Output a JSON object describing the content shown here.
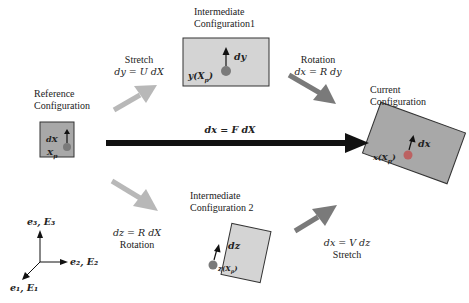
{
  "diagram": {
    "reference": {
      "title_line1": "Reference",
      "title_line2": "Configuration",
      "vector_label": "dX",
      "point_label": "X",
      "point_sub": "p"
    },
    "intermediate1": {
      "title_line1": "Intermediate",
      "title_line2": "Configuration1",
      "vector_label": "dy",
      "point_label": "y(X",
      "point_sub": "p",
      "point_close": ")"
    },
    "intermediate2": {
      "title_line1": "Intermediate",
      "title_line2": "Configuration 2",
      "vector_label": "dz",
      "point_label": "z(X",
      "point_sub": "p",
      "point_close": ")"
    },
    "current": {
      "title_line1": "Current",
      "title_line2": "Configuration",
      "vector_label": "dx",
      "point_label": "x(X",
      "point_sub": "p",
      "point_close": ")"
    },
    "arrows": {
      "stretch_U": {
        "name": "Stretch",
        "equation": "dy = U dX"
      },
      "rotation_R_top": {
        "name": "Rotation",
        "equation": "dx = R dy"
      },
      "deformation_F": {
        "equation": "dx = F dX"
      },
      "rotation_R_bottom": {
        "name": "Rotation",
        "equation": "dz = R dX"
      },
      "stretch_V": {
        "name": "Stretch",
        "equation": "dx = V dz"
      }
    },
    "axes": {
      "e3": "e₃, E₃",
      "e2": "e₂, E₂",
      "e1": "e₁, E₁"
    },
    "colors": {
      "box_fill_dark": "#a8a8a8",
      "box_fill_light": "#d4d4d4",
      "point": "#7a7a7a",
      "arrow_light": "#b8b8b8",
      "arrow_dark": "#7a7a7a",
      "arrow_black": "#111111"
    }
  }
}
